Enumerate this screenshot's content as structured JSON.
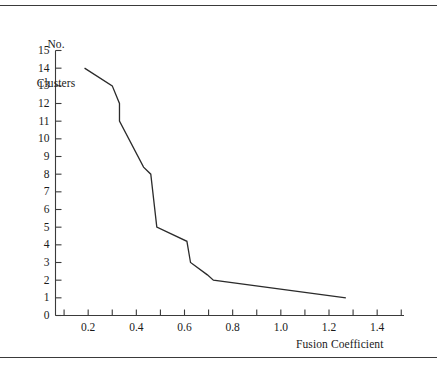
{
  "figure": {
    "background": "#ffffff",
    "line_color": "#2b2b2b",
    "axis_color": "#3a3a3a",
    "rules": {
      "top": "horizontal-rule",
      "bottom": "horizontal-rule"
    }
  },
  "chart_data": {
    "type": "line",
    "title": "",
    "xlabel": "Fusion Coefficient",
    "ylabel": "No.\nClusters",
    "ylabel_lines": [
      "No.",
      "Clusters"
    ],
    "xlim": [
      0.0,
      1.5
    ],
    "ylim": [
      0,
      15
    ],
    "grid": false,
    "legend": null,
    "x_ticks_major": [
      0.2,
      0.4,
      0.6,
      0.8,
      1.0,
      1.2,
      1.4
    ],
    "x_tick_labels": [
      "0.2",
      "0.4",
      "0.6",
      "0.8",
      "1.0",
      "1.2",
      "1.4"
    ],
    "x_ticks_minor": [
      0.1,
      0.3,
      0.5,
      0.7,
      0.9,
      1.1,
      1.3,
      1.5
    ],
    "y_ticks": [
      0,
      1,
      2,
      3,
      4,
      5,
      6,
      7,
      8,
      9,
      10,
      11,
      12,
      13,
      14,
      15
    ],
    "y_tick_labels": [
      "0",
      "1",
      "2",
      "3",
      "4",
      "5",
      "6",
      "7",
      "8",
      "9",
      "10",
      "11",
      "12",
      "13",
      "14",
      "15"
    ],
    "series": [
      {
        "name": "Fusion coefficient scree",
        "x": [
          0.185,
          0.3,
          0.33,
          0.33,
          0.43,
          0.46,
          0.485,
          0.61,
          0.625,
          0.695,
          0.72,
          1.27
        ],
        "y": [
          14.0,
          13.0,
          12.0,
          11.0,
          8.4,
          8.0,
          5.0,
          4.2,
          3.0,
          2.3,
          2.0,
          1.0
        ]
      }
    ]
  }
}
